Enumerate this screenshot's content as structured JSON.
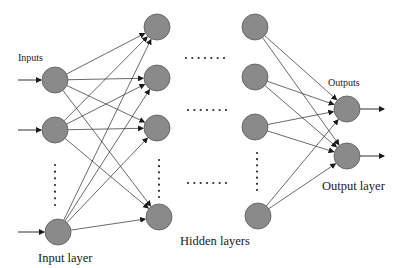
{
  "labels": {
    "inputs": "Inputs",
    "outputs": "Outputs",
    "input_layer": "Input layer",
    "hidden_layers": "Hidden layers",
    "output_layer": "Output layer"
  },
  "colors": {
    "node_fill": "#8a8a8a",
    "node_stroke": "#5a5a5a",
    "edge": "#2a2a2a",
    "background": "#ffffff"
  },
  "layers": [
    {
      "name": "input",
      "nodes": [
        [
          55,
          80
        ],
        [
          55,
          130
        ],
        [
          58,
          232
        ]
      ],
      "ellipsis_vertical": {
        "x": 55,
        "y1": 165,
        "y2": 205
      }
    },
    {
      "name": "hidden1",
      "nodes": [
        [
          157,
          27
        ],
        [
          157,
          78
        ],
        [
          157,
          128
        ],
        [
          159,
          217
        ]
      ],
      "ellipsis_vertical": {
        "x": 159,
        "y1": 160,
        "y2": 197
      }
    },
    {
      "name": "hidden2",
      "nodes": [
        [
          255,
          27
        ],
        [
          255,
          77
        ],
        [
          255,
          127
        ],
        [
          258,
          216
        ]
      ],
      "ellipsis_vertical": {
        "x": 257,
        "y1": 153,
        "y2": 190
      }
    },
    {
      "name": "output",
      "nodes": [
        [
          347,
          109
        ],
        [
          347,
          156
        ]
      ]
    }
  ],
  "node_radius": 13,
  "horizontal_ellipses": [
    {
      "y": 58,
      "x1": 186,
      "x2": 224
    },
    {
      "y": 110,
      "x1": 188,
      "x2": 226
    },
    {
      "y": 183,
      "x1": 188,
      "x2": 226
    }
  ]
}
